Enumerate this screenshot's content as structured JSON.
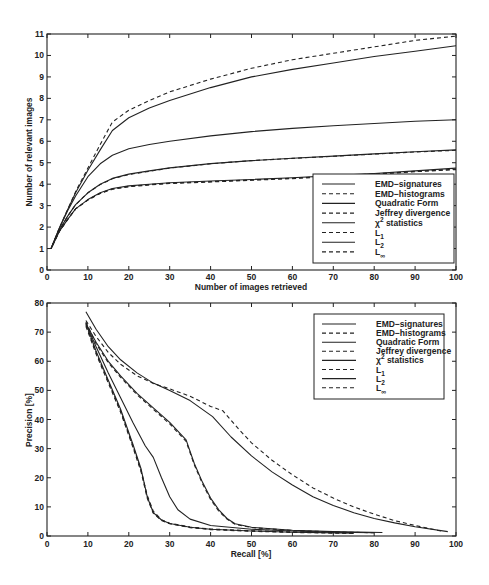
{
  "figure": {
    "panels": [
      {
        "xlabel": "Number of images retrieved",
        "ylabel": "Number of relevant images"
      },
      {
        "xlabel": "Recall [%]",
        "ylabel": "Precision [%]"
      }
    ]
  },
  "chart_data": [
    {
      "type": "line",
      "title": "",
      "xlabel": "Number of images retrieved",
      "ylabel": "Number of relevant images",
      "xlim": [
        0,
        100
      ],
      "ylim": [
        0,
        11
      ],
      "xticks": [
        0,
        10,
        20,
        30,
        40,
        50,
        60,
        70,
        80,
        90,
        100
      ],
      "yticks": [
        0,
        1,
        2,
        3,
        4,
        5,
        6,
        7,
        8,
        9,
        10,
        11
      ],
      "grid": false,
      "legend_position": "lower right",
      "x": [
        0,
        1,
        3,
        5,
        7,
        10,
        13,
        16,
        20,
        25,
        30,
        40,
        50,
        60,
        70,
        80,
        90,
        100
      ],
      "series": [
        {
          "name": "EMD-signatures",
          "style": "solid",
          "label_parts": {
            "base": "EMD−signatures"
          },
          "values": [
            1,
            1,
            1.95,
            2.8,
            3.6,
            4.65,
            5.6,
            6.5,
            7.1,
            7.55,
            7.9,
            8.5,
            9.0,
            9.35,
            9.65,
            9.95,
            10.2,
            10.45
          ]
        },
        {
          "name": "EMD-histograms",
          "style": "dashed",
          "label_parts": {
            "base": "EMD−histograms"
          },
          "values": [
            1,
            1,
            1.95,
            2.8,
            3.65,
            4.75,
            5.85,
            6.9,
            7.45,
            7.9,
            8.3,
            8.9,
            9.4,
            9.8,
            10.1,
            10.4,
            10.7,
            10.9
          ]
        },
        {
          "name": "Quadratic Form",
          "style": "solid",
          "label_parts": {
            "base": "Quadratic Form"
          },
          "values": [
            1,
            1,
            1.95,
            2.75,
            3.45,
            4.35,
            4.95,
            5.35,
            5.65,
            5.85,
            6.0,
            6.25,
            6.45,
            6.6,
            6.72,
            6.83,
            6.93,
            7.0
          ]
        },
        {
          "name": "Jeffrey divergence",
          "style": "dashed",
          "label_parts": {
            "base": "Jeffrey divergence"
          },
          "values": [
            1,
            1,
            1.85,
            2.5,
            3.05,
            3.6,
            3.98,
            4.25,
            4.45,
            4.6,
            4.75,
            4.95,
            5.1,
            5.2,
            5.3,
            5.4,
            5.5,
            5.58
          ]
        },
        {
          "name": "χ² statistics",
          "style": "solid",
          "label_parts": {
            "base": "χ",
            "sup": "2",
            "suffix": " statistics"
          },
          "values": [
            1,
            1,
            1.85,
            2.5,
            3.05,
            3.6,
            4.0,
            4.27,
            4.47,
            4.62,
            4.76,
            4.96,
            5.1,
            5.21,
            5.31,
            5.41,
            5.51,
            5.6
          ]
        },
        {
          "name": "L1",
          "style": "dashed",
          "label_parts": {
            "base": "L",
            "sub": "1"
          },
          "values": [
            1,
            1,
            1.8,
            2.35,
            2.85,
            3.27,
            3.58,
            3.78,
            3.9,
            3.98,
            4.05,
            4.12,
            4.2,
            4.28,
            4.38,
            4.48,
            4.6,
            4.7
          ]
        },
        {
          "name": "L2",
          "style": "solid",
          "label_parts": {
            "base": "L",
            "sub": "2"
          },
          "values": [
            1,
            1,
            1.8,
            2.35,
            2.85,
            3.28,
            3.6,
            3.8,
            3.92,
            4.0,
            4.07,
            4.15,
            4.22,
            4.3,
            4.4,
            4.5,
            4.62,
            4.75
          ]
        },
        {
          "name": "L∞",
          "style": "dashed",
          "label_parts": {
            "base": "L",
            "sub": "∞"
          },
          "values": [
            1,
            1,
            1.8,
            2.35,
            2.85,
            3.26,
            3.57,
            3.76,
            3.88,
            3.96,
            4.03,
            4.1,
            4.18,
            4.26,
            4.36,
            4.46,
            4.58,
            4.68
          ]
        }
      ]
    },
    {
      "type": "line",
      "title": "",
      "xlabel": "Recall [%]",
      "ylabel": "Precision [%]",
      "xlim": [
        0,
        100
      ],
      "ylim": [
        0,
        80
      ],
      "xticks": [
        0,
        10,
        20,
        30,
        40,
        50,
        60,
        70,
        80,
        90,
        100
      ],
      "yticks": [
        0,
        10,
        20,
        30,
        40,
        50,
        60,
        70,
        80
      ],
      "grid": false,
      "legend_position": "upper right",
      "series": [
        {
          "name": "EMD-signatures",
          "style": "solid",
          "label_parts": {
            "base": "EMD−signatures"
          },
          "points": [
            [
              9.5,
              77
            ],
            [
              12,
              71
            ],
            [
              15,
              65
            ],
            [
              18,
              60.5
            ],
            [
              22,
              56
            ],
            [
              26,
              52.5
            ],
            [
              30,
              50
            ],
            [
              35,
              46.5
            ],
            [
              40.5,
              41
            ],
            [
              45,
              34
            ],
            [
              50,
              27.5
            ],
            [
              55,
              22
            ],
            [
              60,
              17.5
            ],
            [
              65,
              13.5
            ],
            [
              70,
              10.5
            ],
            [
              75,
              8
            ],
            [
              80,
              6
            ],
            [
              85,
              4.5
            ],
            [
              90,
              3.2
            ],
            [
              98,
              1.5
            ]
          ]
        },
        {
          "name": "EMD-histograms",
          "style": "dashed",
          "label_parts": {
            "base": "EMD−histograms"
          },
          "points": [
            [
              9.5,
              74
            ],
            [
              12,
              68.5
            ],
            [
              15,
              63
            ],
            [
              18,
              59
            ],
            [
              22,
              55
            ],
            [
              26,
              52.4
            ],
            [
              30,
              50.5
            ],
            [
              35,
              48
            ],
            [
              40,
              44.5
            ],
            [
              43,
              43
            ],
            [
              47,
              36.5
            ],
            [
              50,
              32
            ],
            [
              55,
              26
            ],
            [
              60,
              21
            ],
            [
              65,
              16.5
            ],
            [
              70,
              13
            ],
            [
              75,
              10
            ],
            [
              80,
              7.5
            ],
            [
              85,
              5.3
            ],
            [
              90,
              3.6
            ],
            [
              97,
              1.5
            ]
          ]
        },
        {
          "name": "Quadratic Form",
          "style": "solid",
          "label_parts": {
            "base": "Quadratic Form"
          },
          "points": [
            [
              9.5,
              73
            ],
            [
              12,
              66.5
            ],
            [
              15,
              60
            ],
            [
              18,
              55
            ],
            [
              22,
              49
            ],
            [
              26,
              44
            ],
            [
              30,
              39
            ],
            [
              34,
              33
            ],
            [
              36,
              25
            ],
            [
              38,
              18.5
            ],
            [
              40,
              13
            ],
            [
              42,
              9
            ],
            [
              44,
              6
            ],
            [
              46,
              4.2
            ],
            [
              50,
              3
            ],
            [
              60,
              2
            ],
            [
              70,
              1.5
            ],
            [
              82,
              1.2
            ]
          ]
        },
        {
          "name": "Jeffrey divergence",
          "style": "dashed",
          "label_parts": {
            "base": "Jeffrey divergence"
          },
          "points": [
            [
              9.5,
              73.5
            ],
            [
              12,
              66
            ],
            [
              15,
              59.5
            ],
            [
              18,
              54.5
            ],
            [
              22,
              48.5
            ],
            [
              26,
              43.5
            ],
            [
              30,
              38.5
            ],
            [
              34,
              32.5
            ],
            [
              36,
              24.5
            ],
            [
              38,
              18
            ],
            [
              40,
              12.5
            ],
            [
              42,
              8.5
            ],
            [
              44,
              5.8
            ],
            [
              46,
              4
            ],
            [
              50,
              2.9
            ],
            [
              60,
              1.9
            ],
            [
              70,
              1.4
            ],
            [
              80,
              1.1
            ]
          ]
        },
        {
          "name": "χ² statistics",
          "style": "solid",
          "label_parts": {
            "base": "χ",
            "sup": "2",
            "suffix": " statistics"
          },
          "points": [
            [
              9.5,
              73
            ],
            [
              12,
              65
            ],
            [
              15,
              56
            ],
            [
              18,
              47.5
            ],
            [
              21,
              39
            ],
            [
              24,
              31
            ],
            [
              26,
              27
            ],
            [
              28,
              20
            ],
            [
              30,
              13.5
            ],
            [
              32,
              9
            ],
            [
              35,
              5.8
            ],
            [
              40,
              3.6
            ],
            [
              50,
              2.3
            ],
            [
              60,
              1.7
            ],
            [
              70,
              1.3
            ],
            [
              80,
              1.1
            ]
          ]
        },
        {
          "name": "L1",
          "style": "dashed",
          "label_parts": {
            "base": "L",
            "sub": "1"
          },
          "points": [
            [
              9.5,
              72.5
            ],
            [
              12,
              63
            ],
            [
              15,
              53
            ],
            [
              18,
              43
            ],
            [
              21,
              31
            ],
            [
              23,
              22.5
            ],
            [
              24.5,
              14
            ],
            [
              26,
              8.5
            ],
            [
              28,
              5.6
            ],
            [
              30,
              4.4
            ],
            [
              35,
              3.1
            ],
            [
              40,
              2.4
            ],
            [
              50,
              1.8
            ],
            [
              60,
              1.4
            ],
            [
              75,
              1.0
            ]
          ]
        },
        {
          "name": "L2",
          "style": "solid",
          "label_parts": {
            "base": "L",
            "sub": "2"
          },
          "points": [
            [
              9.5,
              73
            ],
            [
              12,
              63.5
            ],
            [
              15,
              53.5
            ],
            [
              18,
              43.5
            ],
            [
              21,
              31.5
            ],
            [
              23,
              23
            ],
            [
              24.5,
              13.5
            ],
            [
              26,
              8
            ],
            [
              28,
              5.5
            ],
            [
              30,
              4.3
            ],
            [
              35,
              3
            ],
            [
              40,
              2.3
            ],
            [
              50,
              1.7
            ],
            [
              60,
              1.3
            ],
            [
              75,
              1.0
            ]
          ]
        },
        {
          "name": "L∞",
          "style": "dashed",
          "label_parts": {
            "base": "L",
            "sub": "∞"
          },
          "points": [
            [
              9.5,
              72
            ],
            [
              12,
              62.5
            ],
            [
              15,
              52.5
            ],
            [
              18,
              42.5
            ],
            [
              21,
              30.5
            ],
            [
              23,
              22
            ],
            [
              24.5,
              13
            ],
            [
              26,
              7.8
            ],
            [
              28,
              5.3
            ],
            [
              30,
              4.2
            ],
            [
              35,
              2.9
            ],
            [
              40,
              2.2
            ],
            [
              50,
              1.6
            ],
            [
              60,
              1.2
            ],
            [
              75,
              0.9
            ]
          ]
        }
      ]
    }
  ]
}
